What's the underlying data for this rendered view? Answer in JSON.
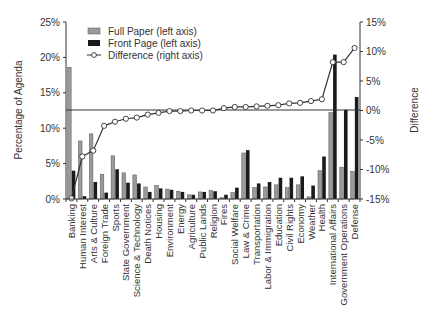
{
  "chart_data": {
    "type": "bar",
    "title": "",
    "xlabel": "",
    "ylabel": "Percentage of Agenda",
    "y2label": "Difference",
    "ylim": [
      0,
      25
    ],
    "y2lim": [
      -15,
      15
    ],
    "yticks": [
      "0%",
      "5%",
      "10%",
      "15%",
      "20%",
      "25%"
    ],
    "y2ticks": [
      "-15%",
      "-10%",
      "-5%",
      "0%",
      "5%",
      "10%",
      "15%"
    ],
    "legend": [
      "Full Paper (left axis)",
      "Front Page (left axis)",
      "Difference (right axis)"
    ],
    "legend_position": "upper left",
    "grid": false,
    "categories": [
      "Banking",
      "Human Interest",
      "Arts & Culture",
      "Foreign Trade",
      "Sports",
      "State Government",
      "Science & Technology",
      "Death Notices",
      "Housing",
      "Environment",
      "Energy",
      "Agriculture",
      "Public Lands",
      "Religion",
      "Fires",
      "Social Welfare",
      "Law & Crime",
      "Transportation",
      "Labor & Immigration",
      "Education",
      "Civil Rights",
      "Economy",
      "Weather",
      "Health",
      "International Affairs",
      "Government Operations",
      "Defense"
    ],
    "series": [
      {
        "name": "Full Paper (left axis)",
        "type": "bar",
        "axis": "left",
        "color": "#999999",
        "values": [
          18.6,
          8.2,
          9.2,
          3.5,
          6.1,
          3.7,
          3.4,
          1.7,
          1.9,
          1.4,
          1.1,
          0.6,
          1.0,
          1.2,
          0.2,
          0.9,
          6.5,
          1.6,
          1.7,
          2.0,
          1.6,
          2.0,
          0.3,
          4.0,
          12.2,
          4.5,
          3.9
        ]
      },
      {
        "name": "Front Page (left axis)",
        "type": "bar",
        "axis": "left",
        "color": "#1a1a1a",
        "values": [
          4.0,
          0.4,
          2.4,
          0.9,
          4.2,
          2.3,
          2.2,
          1.0,
          1.5,
          1.3,
          1.0,
          0.6,
          1.0,
          1.1,
          0.6,
          1.6,
          6.9,
          2.2,
          2.4,
          3.0,
          3.0,
          3.2,
          1.9,
          6.0,
          20.4,
          12.6,
          14.4
        ]
      },
      {
        "name": "Difference (right axis)",
        "type": "line",
        "axis": "right",
        "color": "#333333",
        "values": [
          -14.9,
          -7.8,
          -6.8,
          -2.6,
          -1.9,
          -1.4,
          -1.2,
          -0.7,
          -0.4,
          -0.1,
          -0.1,
          0.0,
          0.0,
          0.0,
          0.4,
          0.6,
          0.6,
          0.7,
          0.8,
          0.9,
          1.2,
          1.3,
          1.6,
          1.9,
          8.2,
          8.2,
          10.6
        ]
      }
    ]
  }
}
